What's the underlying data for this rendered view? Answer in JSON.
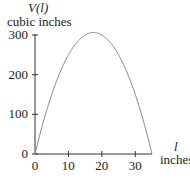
{
  "chart_data": {
    "type": "line",
    "title": "",
    "ylabel": "V(l)",
    "ylabel_units": "cubic inches",
    "xlabel": "l",
    "xlabel_units": "inches",
    "xlim": [
      0,
      35
    ],
    "ylim": [
      0,
      300
    ],
    "x_ticks": [
      0,
      10,
      20,
      30
    ],
    "y_ticks": [
      0,
      100,
      200,
      300
    ],
    "x_tick_labels": [
      "0",
      "10",
      "20",
      "30"
    ],
    "y_tick_labels": [
      "0",
      "100",
      "200",
      "300"
    ],
    "grid": false,
    "legend": null,
    "series": [
      {
        "name": "V(l)",
        "x": [
          0,
          2.5,
          5,
          7.5,
          10,
          12.5,
          15,
          17.5,
          20,
          22.5,
          25,
          27.5,
          30,
          32.5,
          35
        ],
        "values": [
          0,
          81,
          150,
          206,
          250,
          281,
          300,
          306,
          300,
          281,
          250,
          206,
          150,
          81,
          0
        ],
        "color": "#888888"
      }
    ]
  },
  "labels": {
    "y_title": "V(l)",
    "y_units": "cubic inches",
    "x_title": "l",
    "x_units": "inches"
  }
}
